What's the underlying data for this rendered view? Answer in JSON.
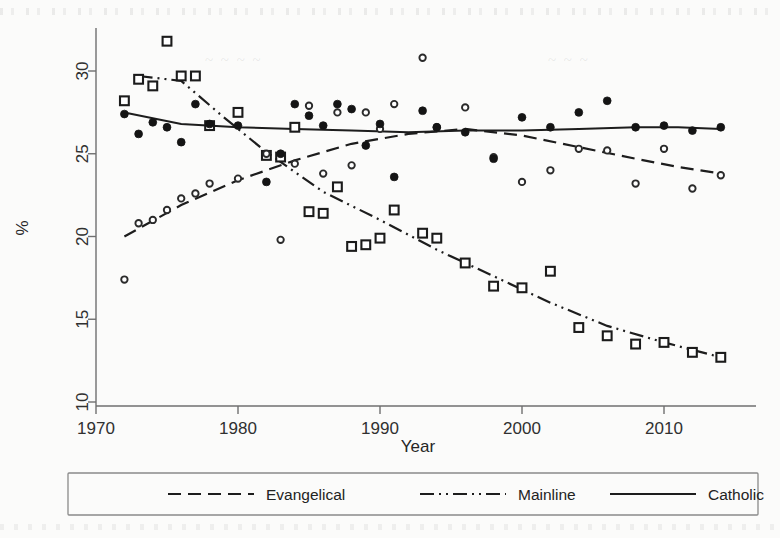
{
  "figure": {
    "background_color": "#fbfbfa",
    "ink_color": "#1d1d1d"
  },
  "axes": {
    "x": {
      "title": "Year",
      "tick_labels": [
        "1970",
        "1980",
        "1990",
        "2010",
        "2000"
      ],
      "ticks": [
        1970,
        1980,
        1990,
        2000,
        2010
      ],
      "range": [
        1968.6,
        2015.5
      ]
    },
    "y": {
      "title": "%",
      "tick_labels": [
        "10",
        "15",
        "20",
        "25",
        "30"
      ],
      "ticks": [
        10,
        15,
        20,
        25,
        30
      ],
      "range": [
        9.0,
        32.8
      ]
    }
  },
  "legend": {
    "position": "below-axes",
    "entries": [
      {
        "label": "Evangelical",
        "style": "dashed",
        "marker": "open-circle-small"
      },
      {
        "label": "Mainline",
        "style": "dash-dot",
        "marker": "open-square"
      },
      {
        "label": "Catholic",
        "style": "solid",
        "marker": "filled-circle"
      }
    ]
  },
  "chart_data": {
    "type": "scatter",
    "title": "",
    "subtitle": "",
    "xlabel": "Year",
    "ylabel": "%",
    "xlim": [
      1968.6,
      2015.5
    ],
    "ylim": [
      9.0,
      32.8
    ],
    "xticks": [
      1970,
      1980,
      1990,
      2000,
      2010
    ],
    "yticks": [
      10,
      15,
      20,
      25,
      30
    ],
    "grid": false,
    "legend_position": "bottom",
    "series": [
      {
        "name": "Evangelical",
        "marker": "open-circle-small",
        "line_style": "dashed",
        "points": [
          {
            "x": 1972,
            "y": 17.4
          },
          {
            "x": 1973,
            "y": 20.8
          },
          {
            "x": 1974,
            "y": 21.0
          },
          {
            "x": 1975,
            "y": 21.6
          },
          {
            "x": 1976,
            "y": 22.3
          },
          {
            "x": 1977,
            "y": 22.6
          },
          {
            "x": 1978,
            "y": 23.2
          },
          {
            "x": 1980,
            "y": 23.5
          },
          {
            "x": 1982,
            "y": 25.0
          },
          {
            "x": 1983,
            "y": 19.8
          },
          {
            "x": 1984,
            "y": 24.4
          },
          {
            "x": 1985,
            "y": 27.9
          },
          {
            "x": 1986,
            "y": 23.8
          },
          {
            "x": 1987,
            "y": 27.5
          },
          {
            "x": 1988,
            "y": 24.3
          },
          {
            "x": 1989,
            "y": 27.5
          },
          {
            "x": 1990,
            "y": 26.5
          },
          {
            "x": 1991,
            "y": 28.0
          },
          {
            "x": 1993,
            "y": 30.8
          },
          {
            "x": 1994,
            "y": 26.6
          },
          {
            "x": 1996,
            "y": 27.8
          },
          {
            "x": 1998,
            "y": 24.8
          },
          {
            "x": 2000,
            "y": 23.3
          },
          {
            "x": 2002,
            "y": 24.0
          },
          {
            "x": 2004,
            "y": 25.3
          },
          {
            "x": 2006,
            "y": 25.2
          },
          {
            "x": 2008,
            "y": 23.2
          },
          {
            "x": 2010,
            "y": 25.3
          },
          {
            "x": 2012,
            "y": 22.9
          },
          {
            "x": 2014,
            "y": 23.7
          }
        ],
        "fit": [
          {
            "x": 1972,
            "y": 20.0
          },
          {
            "x": 1976,
            "y": 21.9
          },
          {
            "x": 1980,
            "y": 23.4
          },
          {
            "x": 1984,
            "y": 24.6
          },
          {
            "x": 1988,
            "y": 25.6
          },
          {
            "x": 1992,
            "y": 26.2
          },
          {
            "x": 1996,
            "y": 26.5
          },
          {
            "x": 2000,
            "y": 26.1
          },
          {
            "x": 2004,
            "y": 25.4
          },
          {
            "x": 2008,
            "y": 24.7
          },
          {
            "x": 2011,
            "y": 24.2
          },
          {
            "x": 2014,
            "y": 23.8
          }
        ]
      },
      {
        "name": "Mainline",
        "marker": "open-square",
        "line_style": "dash-dot",
        "points": [
          {
            "x": 1972,
            "y": 28.2
          },
          {
            "x": 1973,
            "y": 29.5
          },
          {
            "x": 1974,
            "y": 29.1
          },
          {
            "x": 1975,
            "y": 31.8
          },
          {
            "x": 1976,
            "y": 29.7
          },
          {
            "x": 1977,
            "y": 29.7
          },
          {
            "x": 1978,
            "y": 26.7
          },
          {
            "x": 1980,
            "y": 27.5
          },
          {
            "x": 1982,
            "y": 24.9
          },
          {
            "x": 1983,
            "y": 24.8
          },
          {
            "x": 1984,
            "y": 26.6
          },
          {
            "x": 1985,
            "y": 21.5
          },
          {
            "x": 1986,
            "y": 21.4
          },
          {
            "x": 1987,
            "y": 23.0
          },
          {
            "x": 1988,
            "y": 19.4
          },
          {
            "x": 1989,
            "y": 19.5
          },
          {
            "x": 1990,
            "y": 19.9
          },
          {
            "x": 1991,
            "y": 21.6
          },
          {
            "x": 1993,
            "y": 20.2
          },
          {
            "x": 1994,
            "y": 19.9
          },
          {
            "x": 1996,
            "y": 18.4
          },
          {
            "x": 1998,
            "y": 17.0
          },
          {
            "x": 2000,
            "y": 16.9
          },
          {
            "x": 2002,
            "y": 17.9
          },
          {
            "x": 2004,
            "y": 14.5
          },
          {
            "x": 2006,
            "y": 14.0
          },
          {
            "x": 2008,
            "y": 13.5
          },
          {
            "x": 2010,
            "y": 13.6
          },
          {
            "x": 2012,
            "y": 13.0
          },
          {
            "x": 2014,
            "y": 12.7
          }
        ],
        "fit": [
          {
            "x": 1973,
            "y": 29.7
          },
          {
            "x": 1976,
            "y": 29.4
          },
          {
            "x": 1979,
            "y": 27.2
          },
          {
            "x": 1982,
            "y": 25.1
          },
          {
            "x": 1986,
            "y": 22.7
          },
          {
            "x": 1990,
            "y": 21.0
          },
          {
            "x": 1994,
            "y": 19.2
          },
          {
            "x": 1998,
            "y": 17.6
          },
          {
            "x": 2002,
            "y": 16.0
          },
          {
            "x": 2006,
            "y": 14.6
          },
          {
            "x": 2010,
            "y": 13.6
          },
          {
            "x": 2014,
            "y": 12.7
          }
        ]
      },
      {
        "name": "Catholic",
        "marker": "filled-circle",
        "line_style": "solid",
        "points": [
          {
            "x": 1972,
            "y": 27.4
          },
          {
            "x": 1973,
            "y": 26.2
          },
          {
            "x": 1974,
            "y": 26.9
          },
          {
            "x": 1975,
            "y": 26.6
          },
          {
            "x": 1976,
            "y": 25.7
          },
          {
            "x": 1977,
            "y": 28.0
          },
          {
            "x": 1978,
            "y": 26.8
          },
          {
            "x": 1980,
            "y": 26.7
          },
          {
            "x": 1982,
            "y": 23.3
          },
          {
            "x": 1983,
            "y": 25.0
          },
          {
            "x": 1984,
            "y": 28.0
          },
          {
            "x": 1985,
            "y": 27.3
          },
          {
            "x": 1986,
            "y": 26.7
          },
          {
            "x": 1987,
            "y": 28.0
          },
          {
            "x": 1988,
            "y": 27.7
          },
          {
            "x": 1989,
            "y": 25.5
          },
          {
            "x": 1990,
            "y": 26.8
          },
          {
            "x": 1991,
            "y": 23.6
          },
          {
            "x": 1993,
            "y": 27.6
          },
          {
            "x": 1994,
            "y": 26.6
          },
          {
            "x": 1996,
            "y": 26.3
          },
          {
            "x": 1998,
            "y": 24.7
          },
          {
            "x": 2000,
            "y": 27.2
          },
          {
            "x": 2002,
            "y": 26.6
          },
          {
            "x": 2004,
            "y": 27.5
          },
          {
            "x": 2006,
            "y": 28.2
          },
          {
            "x": 2008,
            "y": 26.6
          },
          {
            "x": 2010,
            "y": 26.7
          },
          {
            "x": 2012,
            "y": 26.4
          },
          {
            "x": 2014,
            "y": 26.6
          }
        ],
        "fit": [
          {
            "x": 1972,
            "y": 27.5
          },
          {
            "x": 1976,
            "y": 26.8
          },
          {
            "x": 1980,
            "y": 26.6
          },
          {
            "x": 1984,
            "y": 26.5
          },
          {
            "x": 1988,
            "y": 26.4
          },
          {
            "x": 1992,
            "y": 26.3
          },
          {
            "x": 1996,
            "y": 26.4
          },
          {
            "x": 2000,
            "y": 26.4
          },
          {
            "x": 2004,
            "y": 26.5
          },
          {
            "x": 2008,
            "y": 26.6
          },
          {
            "x": 2011,
            "y": 26.6
          },
          {
            "x": 2014,
            "y": 26.5
          }
        ]
      }
    ]
  }
}
